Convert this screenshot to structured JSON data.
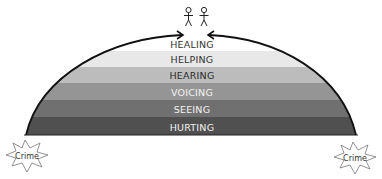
{
  "diagram": {
    "type": "layered-dome",
    "layers": [
      {
        "label": "HEALING",
        "fill": "#ffffff",
        "text": "#333333"
      },
      {
        "label": "HELPING",
        "fill": "#e8e8e8",
        "text": "#333333"
      },
      {
        "label": "HEARING",
        "fill": "#bcbcbc",
        "text": "#2a2a2a"
      },
      {
        "label": "VOICING",
        "fill": "#959595",
        "text": "#f2f2f2"
      },
      {
        "label": "SEEING",
        "fill": "#707070",
        "text": "#f2f2f2"
      },
      {
        "label": "HURTING",
        "fill": "#505050",
        "text": "#f2f2f2"
      }
    ],
    "left_node": {
      "label": "Crime"
    },
    "right_node": {
      "label": "Crime"
    },
    "top_figures": {
      "count": 2,
      "icon": "person-icon"
    }
  }
}
